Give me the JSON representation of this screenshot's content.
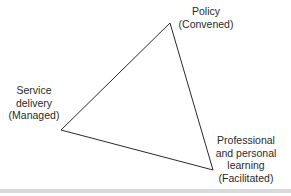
{
  "diagram": {
    "type": "triangle",
    "vertices": {
      "top": {
        "x": 170,
        "y": 23
      },
      "left": {
        "x": 61,
        "y": 130
      },
      "bottom_right": {
        "x": 213,
        "y": 170
      }
    },
    "stroke_color": "#2a2a2a",
    "nodes": [
      {
        "id": "policy",
        "lines": [
          "Policy",
          "(Convened)"
        ]
      },
      {
        "id": "service-delivery",
        "lines": [
          "Service",
          "delivery",
          "(Managed)"
        ]
      },
      {
        "id": "professional-learning",
        "lines": [
          "Professional",
          "and personal",
          "learning",
          "(Facilitated)"
        ]
      }
    ],
    "band_color": "#d9d9d9"
  }
}
